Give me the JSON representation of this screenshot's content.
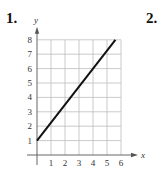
{
  "problems": [
    {
      "label": "1."
    },
    {
      "label": "2."
    }
  ],
  "chart_data": {
    "type": "line",
    "title": "",
    "xlabel": "x",
    "ylabel": "y",
    "xlim": [
      0,
      6
    ],
    "ylim": [
      0,
      8
    ],
    "grid": true,
    "x_ticks": [
      "1",
      "2",
      "3",
      "4",
      "5",
      "6"
    ],
    "y_ticks": [
      "1",
      "2",
      "3",
      "4",
      "5",
      "6",
      "7",
      "8"
    ],
    "series": [
      {
        "name": "line",
        "points": [
          [
            0,
            1
          ],
          [
            5.6,
            8
          ]
        ]
      }
    ],
    "colors": {
      "line": "#111111",
      "grid": "#bdbdbd",
      "axis": "#555555"
    }
  }
}
